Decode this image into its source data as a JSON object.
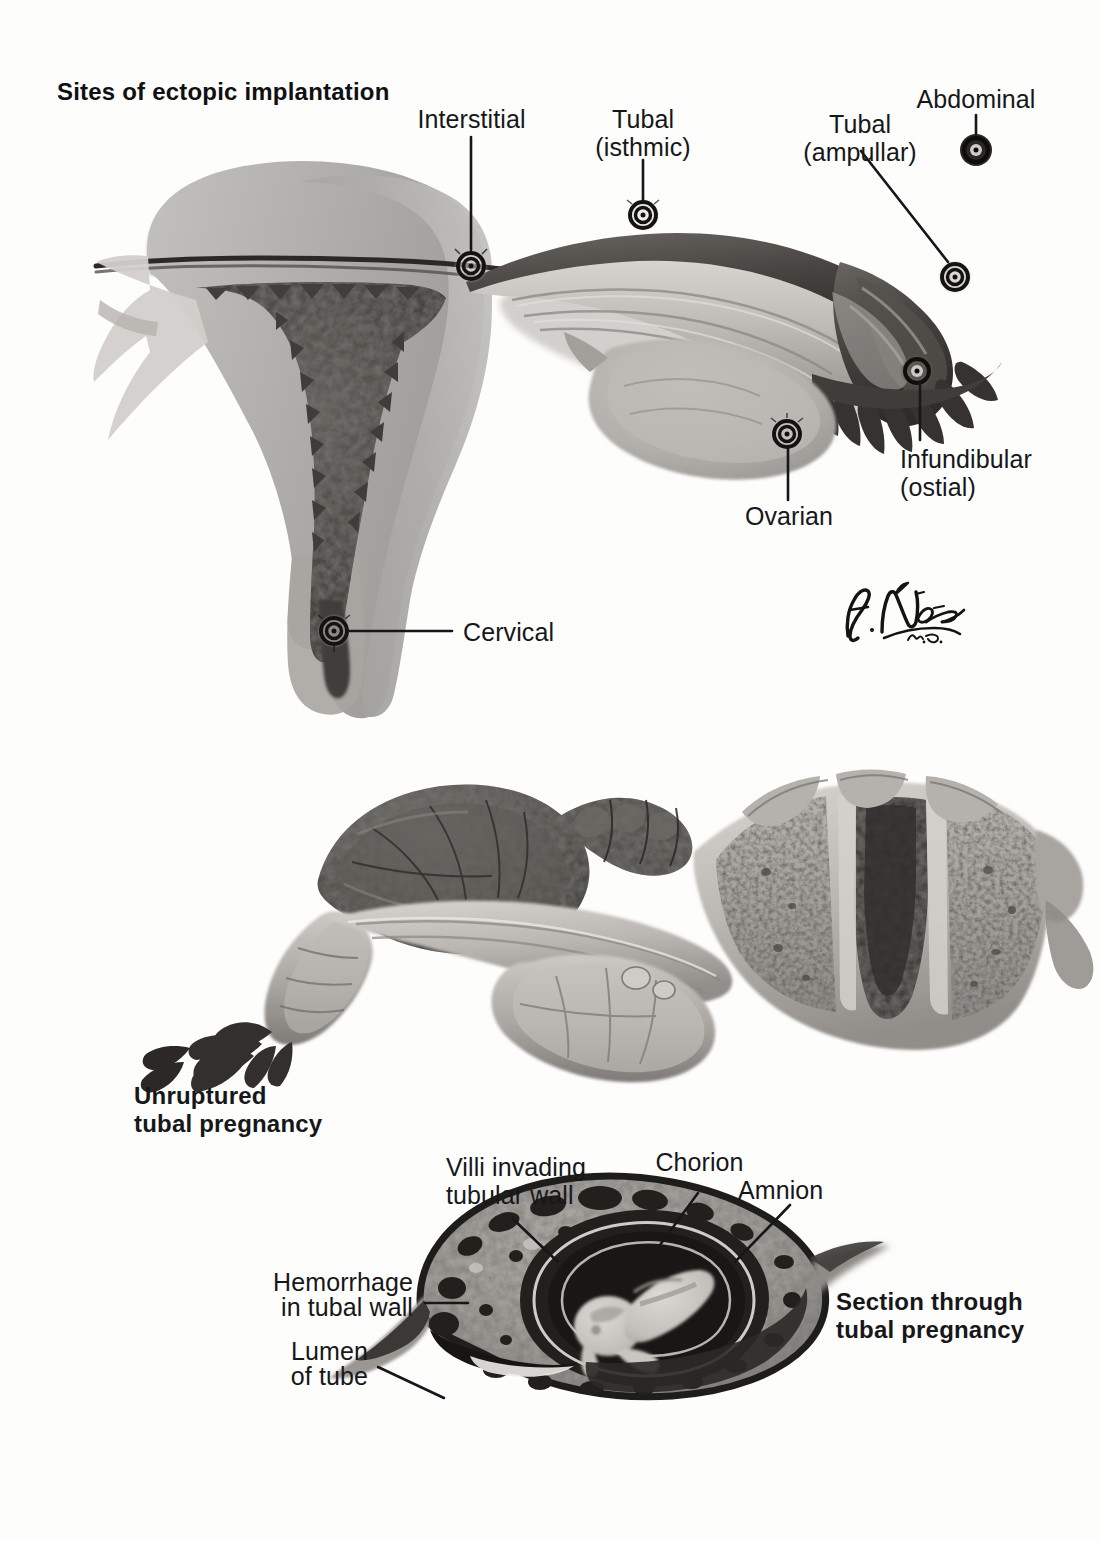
{
  "plate": {
    "title": "Sites of ectopic implantation",
    "signature": "F. Netter, M.D."
  },
  "figures": [
    {
      "id": "sites-of-ectopic-implantation",
      "caption": "Sites of ectopic implantation",
      "description": "Coronal section of uterus, fallopian tube and ovary showing the possible sites at which an ectopic gestation may implant. Each site is marked with a small dark concentric target symbol.",
      "labels": [
        {
          "name": "interstitial",
          "text": "Interstitial",
          "align": "center"
        },
        {
          "name": "tubal-isthmic",
          "text": "Tubal\n(isthmic)",
          "align": "center"
        },
        {
          "name": "tubal-ampullar",
          "text": "Tubal\n(ampullar)",
          "align": "center"
        },
        {
          "name": "abdominal",
          "text": "Abdominal",
          "align": "center"
        },
        {
          "name": "infundibular-ostial",
          "text": "Infundibular\n(ostial)",
          "align": "left"
        },
        {
          "name": "ovarian",
          "text": "Ovarian",
          "align": "center"
        },
        {
          "name": "cervical",
          "text": "Cervical",
          "align": "left"
        }
      ]
    },
    {
      "id": "unruptured-tubal-pregnancy",
      "caption": "Unruptured\ntubal pregnancy",
      "description": "Gross specimen view of uterus with an intact distended fallopian tube containing an unruptured tubal pregnancy; the uterine cavity is opened on the right.",
      "labels": []
    },
    {
      "id": "section-through-tubal-pregnancy",
      "caption": "Section through\ntubal pregnancy",
      "description": "Cross section through a gravid fallopian tube showing the embryo within amnion and chorion, surrounded by hemorrhagic tubal wall invaded by villi.",
      "labels": [
        {
          "name": "villi-invading-tubular-wall",
          "text": "Villi invading\ntubular wall",
          "align": "left"
        },
        {
          "name": "chorion",
          "text": "Chorion",
          "align": "center"
        },
        {
          "name": "amnion",
          "text": "Amnion",
          "align": "left"
        },
        {
          "name": "hemorrhage-in-tubal-wall",
          "text": "Hemorrhage\nin tubal wall",
          "align": "right"
        },
        {
          "name": "lumen-of-tube",
          "text": "Lumen\nof tube",
          "align": "right"
        }
      ]
    }
  ],
  "labels": {
    "interstitial": "Interstitial",
    "tubal_isthmic_line1": "Tubal",
    "tubal_isthmic_line2": "(isthmic)",
    "tubal_ampullar_line1": "Tubal",
    "tubal_ampullar_line2": "(ampullar)",
    "abdominal": "Abdominal",
    "infundibular_line1": "Infundibular",
    "infundibular_line2": "(ostial)",
    "ovarian": "Ovarian",
    "cervical": "Cervical",
    "unruptured_line1": "Unruptured",
    "unruptured_line2": "tubal pregnancy",
    "villi_line1": "Villi invading",
    "villi_line2": "tubular wall",
    "chorion": "Chorion",
    "amnion": "Amnion",
    "hemorrhage_line1": "Hemorrhage",
    "hemorrhage_line2": "in tubal wall",
    "lumen_line1": "Lumen",
    "lumen_line2": "of tube",
    "section_line1": "Section through",
    "section_line2": "tubal pregnancy"
  },
  "colors": {
    "background": "#fdfdfc",
    "text": "#17171a",
    "leader": "#17171a",
    "myometrium_light": "#b9b7b4",
    "myometrium_mid": "#a09e9b",
    "endometrium_dark": "#4e4b48",
    "cavity_dark": "#3a3734",
    "tube_light": "#cecbc7",
    "tube_mid": "#aaa7a3",
    "tube_dark": "#4a4744",
    "fimbriae_dark": "#3b3835",
    "ovary": "#b4b1ad",
    "specimen_light": "#c9c6c1",
    "specimen_mid": "#9c9994",
    "specimen_dark": "#56534f",
    "hemorrhage": "#2e2b29",
    "amnion_ring": "#201e1c",
    "embryo": "#cbc8c3",
    "target_ring": "#141312"
  }
}
